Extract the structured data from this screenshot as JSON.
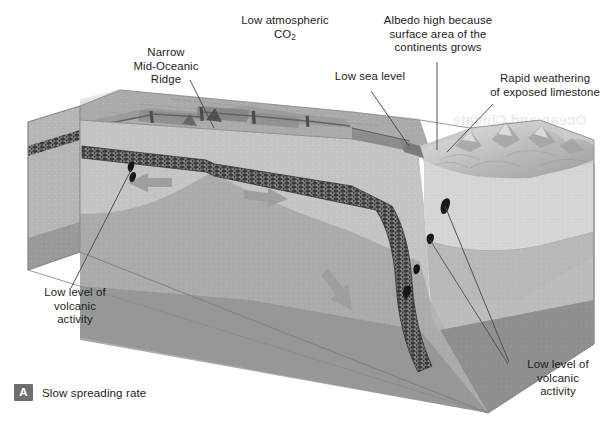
{
  "figure": {
    "type": "geological-block-diagram",
    "title_caption": "Slow spreading rate",
    "panel_letter": "A",
    "background_color": "#ffffff",
    "text_color": "#1c1c1c",
    "badge_color": "#6e6e6e"
  },
  "labels": {
    "co2": "Low atmospheric",
    "co2_formula_pre": "CO",
    "co2_formula_sub": "2",
    "ridge_line1": "Narrow",
    "ridge_line2": "Mid-Oceanic",
    "ridge_line3": "Ridge",
    "sea_level": "Low sea level",
    "albedo_line1": "Albedo high because",
    "albedo_line2": "surface area of the",
    "albedo_line3": "continents grows",
    "weathering_line1": "Rapid weathering",
    "weathering_line2": "of exposed limestone",
    "volcanic_left_line1": "Low level of",
    "volcanic_left_line2": "volcanic",
    "volcanic_left_line3": "activity",
    "volcanic_right_line1": "Low level of",
    "volcanic_right_line2": "volcanic",
    "volcanic_right_line3": "activity"
  },
  "bleed_through_text": "Ocean and Climate",
  "palette": {
    "sea_surface": "#c9cbcc",
    "sea_surface_light": "#e4e5e6",
    "ocean_floor": "#9a9c9d",
    "ocean_floor_dark": "#87898a",
    "oceanic_crust": "#3b3b3b",
    "upper_mantle": "#bfc0c0",
    "mantle_mid": "#a9abab",
    "mantle_deep": "#949596",
    "lower_layer": "#8b8d8e",
    "continent_top": "#c6c7c8",
    "continent_crust": "#d6d7d7",
    "arrow_gray": "#9b9d9e",
    "leader_line": "#4a4a4a",
    "volcano_black": "#1a1a1a"
  },
  "features": [
    {
      "name": "mid-oceanic-ridge",
      "description": "narrow spreading ridge with transform faults"
    },
    {
      "name": "oceanic-crust-slab",
      "description": "dark stippled crust layer, subducting at right"
    },
    {
      "name": "subduction-zone",
      "description": "slab descends beneath continent"
    },
    {
      "name": "continent-mountains",
      "description": "exposed continental land with mountain range"
    },
    {
      "name": "mantle-flow-arrows",
      "description": "divergent arrows at ridge, downward arrow at slab"
    },
    {
      "name": "volcano-vents",
      "description": "small black volcanic vents on ridge and above slab"
    }
  ]
}
